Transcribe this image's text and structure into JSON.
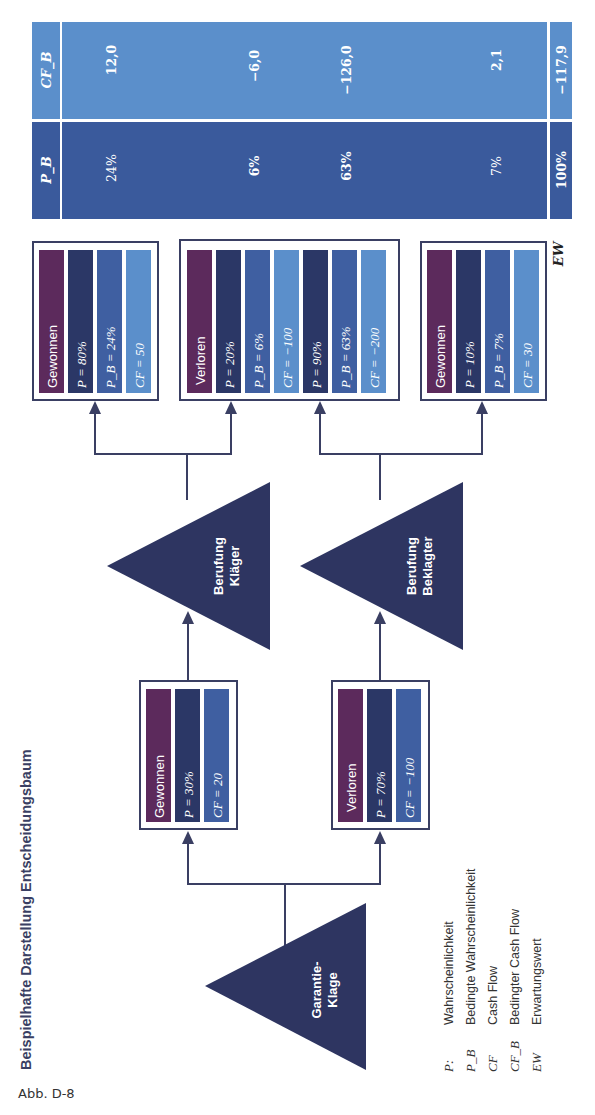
{
  "title": "Beispielhafte Darstellung Entscheidungsbaum",
  "caption": "Abb. D-8",
  "colors": {
    "navy": "#2e3561",
    "purple": "#5c2a5c",
    "dark_blue": "#2b3766",
    "mid_blue": "#3f5fa1",
    "light_blue": "#5b8fcb",
    "table_pb": "#3a5a9c",
    "table_cfb": "#5b8fcb",
    "line": "#3a3f63"
  },
  "nodes": {
    "root": {
      "label_line1": "Garantie-",
      "label_line2": "Klage"
    },
    "appeal_plaintiff": {
      "label_line1": "Berufung",
      "label_line2": "Kläger"
    },
    "appeal_defendant": {
      "label_line1": "Berufung",
      "label_line2": "Beklagter"
    }
  },
  "level1": {
    "won": {
      "label": "Gewonnen",
      "p": "P  =  30%",
      "cf": "CF = 20"
    },
    "lost": {
      "label": "Verloren",
      "p": "P  =  70%",
      "cf": "CF = −100"
    }
  },
  "level2": {
    "won": {
      "label": "Gewonnen",
      "p": "P  =  80%",
      "pb": "P_B = 24%",
      "cf": "CF = 50"
    },
    "lost": {
      "label": "Verloren",
      "p1": "P  =  20%",
      "pb1": "P_B = 6%",
      "cf1": "CF = −100",
      "p2": "P  =  90%",
      "pb2": "P_B = 63%",
      "cf2": "CF = −200"
    },
    "won_defendant": {
      "label": "Gewonnen",
      "p": "P  =  10%",
      "pb": "P_B = 7%",
      "cf": "CF = 30"
    }
  },
  "table": {
    "header_cfb": "CF_B",
    "header_pb": "P_B",
    "rows": [
      {
        "pb": "24%",
        "cfb": "12,0"
      },
      {
        "pb": "6%",
        "cfb": "−6,0"
      },
      {
        "pb": "63%",
        "cfb": "−126,0"
      },
      {
        "pb": "7%",
        "cfb": "2,1"
      }
    ],
    "total": {
      "label": "EW",
      "pb": "100%",
      "cfb": "−117,9"
    }
  },
  "legend": [
    {
      "symbol": "P:",
      "text": "Wahrscheinlichkeit"
    },
    {
      "symbol": "P_B",
      "text": "Bedingte Wahrscheinlichkeit"
    },
    {
      "symbol": "CF",
      "text": "Cash Flow"
    },
    {
      "symbol": "CF_B",
      "text": "Bedingter Cash Flow"
    },
    {
      "symbol": "EW",
      "text": "Erwartungswert"
    }
  ]
}
